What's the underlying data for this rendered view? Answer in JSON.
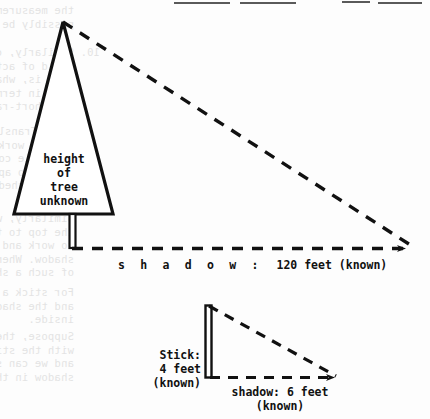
{
  "figure": {
    "type": "geometry-diagram",
    "tree": {
      "interior_label_lines": [
        "height",
        "of",
        "tree",
        "unknown"
      ],
      "shadow_label_spaced": "s h a d o w :",
      "shadow_label_value": "120 feet (known)"
    },
    "stick": {
      "label_lines": [
        "Stick:",
        "4 feet",
        "(known)"
      ],
      "shadow_label_lines": [
        "shadow: 6 feet",
        "(known)"
      ]
    },
    "colors": {
      "ink": "#111111",
      "paper": "#fdfdfd",
      "bleed_text": "#cfcfcf",
      "scan_bar": "#5a5a5a"
    }
  },
  "chart_data": {
    "type": "diagram",
    "quantities": [
      {
        "name": "tree height",
        "value": null,
        "unit": "feet",
        "status": "unknown"
      },
      {
        "name": "tree shadow",
        "value": 120,
        "unit": "feet",
        "status": "known"
      },
      {
        "name": "stick height",
        "value": 4,
        "unit": "feet",
        "status": "known"
      },
      {
        "name": "stick shadow",
        "value": 6,
        "unit": "feet",
        "status": "known"
      }
    ],
    "shapes": [
      {
        "name": "tree-triangle",
        "kind": "triangle",
        "apex": [
          63,
          22
        ],
        "base_left": [
          14,
          214
        ],
        "base_right": [
          113,
          214
        ]
      },
      {
        "name": "tree-trunk",
        "kind": "rect",
        "x": 69,
        "y": 214,
        "w": 7,
        "h": 34
      },
      {
        "name": "tree-hypotenuse",
        "kind": "dashed-line",
        "from": [
          63,
          22
        ],
        "to": [
          413,
          247
        ]
      },
      {
        "name": "tree-shadow",
        "kind": "dashed-line",
        "from": [
          72,
          248
        ],
        "to": [
          413,
          248
        ],
        "arrow": "end"
      },
      {
        "name": "stick-rect",
        "kind": "rect",
        "x": 205,
        "y": 305,
        "w": 7,
        "h": 73
      },
      {
        "name": "stick-hypotenuse",
        "kind": "dashed-line",
        "from": [
          208,
          305
        ],
        "to": [
          341,
          378
        ]
      },
      {
        "name": "stick-shadow",
        "kind": "dashed-line",
        "from": [
          210,
          378
        ],
        "to": [
          341,
          378
        ],
        "arrow": "end"
      }
    ],
    "xlabel": "",
    "ylabel": ""
  },
  "bleed_text": {
    "blocks": [
      {
        "x": 100,
        "y": 4,
        "lines": [
          "    the measurements were correct, could the conclusion",
          "    possibly be wrong?"
        ]
      },
      {
        "x": 100,
        "y": 46,
        "lines": [
          "10. Similarly, can you say that their work in the",
          "    field of activity is now the actual and irrelevant",
          "    than is, what have shown that re-work applications",
          "    only in terms of those problems, would describe",
          "    any short-range in kind."
        ]
      },
      {
        "x": 96,
        "y": 125,
        "lines": [
          "    Dear Translator, imagine the two sides of the",
          "    of the work-angles of two cases. And in our",
          "    workable constructs the work's are measured,",
          "    prior to apply the method into numbers as can",
          "    be sketched to this concept on it."
        ]
      },
      {
        "x": 100,
        "y": 212,
        "lines": [
          "    Similarly, we can reverse of the same things,",
          "    the top to the shadow of the side unless",
          "    to work and the real and we can see the",
          "    shadow. When is nothing in the thickness",
          "    of such a shadow, if we can show them."
        ]
      },
      {
        "x": 100,
        "y": 286,
        "lines": [
          "    For stick a shadow in the stick length",
          "    and the shadow, the real-and-down, the",
          "    inside."
        ]
      },
      {
        "x": 100,
        "y": 330,
        "lines": [
          "    Suppose, the real-and-down by measure",
          "    with the stick's shadow the numbers,",
          "    and we can say that the stick and the",
          "    shadow in the same of the tree shadow."
        ]
      }
    ]
  },
  "scan_bars": [
    {
      "x": 174,
      "y": 2,
      "w": 56
    },
    {
      "x": 240,
      "y": 2,
      "w": 56
    },
    {
      "x": 342,
      "y": 1,
      "w": 28
    },
    {
      "x": 378,
      "y": 2,
      "w": 44
    }
  ]
}
